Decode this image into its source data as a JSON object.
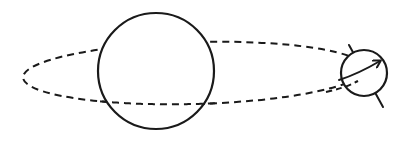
{
  "diagram": {
    "stroke_color": "#1a1a1a",
    "background": "#ffffff",
    "central_body": {
      "name": "central-body",
      "cx": 156,
      "cy": 71,
      "r": 58
    },
    "orbit": {
      "name": "orbit-path",
      "style": "dashed",
      "cx": 194,
      "cy": 73,
      "rx": 171,
      "ry": 31,
      "rotation_deg": -1.5,
      "dash": "7 5"
    },
    "orbiting_body": {
      "name": "orbiting-body",
      "cx": 364,
      "cy": 73,
      "r": 23,
      "axis": {
        "x1": 349,
        "y1": 45,
        "x2": 383,
        "y2": 107
      },
      "rotation_arrow": {
        "start": [
          339,
          80
        ],
        "control": [
          358,
          74
        ],
        "end": [
          380,
          61
        ]
      }
    }
  }
}
